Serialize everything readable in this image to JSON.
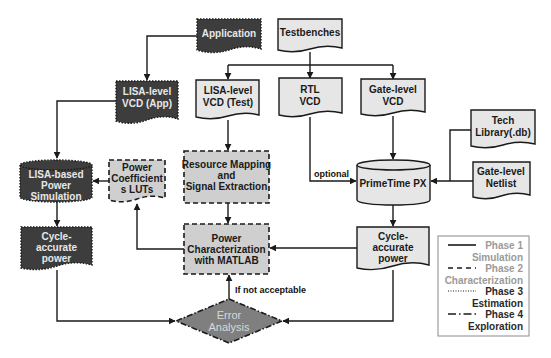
{
  "diagram": {
    "nodes": {
      "application": {
        "label_lines": [
          "Application"
        ],
        "style": "dark-dotted",
        "shape": "document"
      },
      "testbenches": {
        "label_lines": [
          "Testbenches"
        ],
        "style": "light-solid",
        "shape": "document"
      },
      "lisa_vcd_app": {
        "label_lines": [
          "LISA-level",
          "VCD (App)"
        ],
        "style": "dark-dotted",
        "shape": "document"
      },
      "lisa_vcd_test": {
        "label_lines": [
          "LISA-level",
          "VCD (Test)"
        ],
        "style": "light-solid",
        "shape": "document"
      },
      "rtl_vcd": {
        "label_lines": [
          "RTL",
          "VCD"
        ],
        "style": "light-solid",
        "shape": "document"
      },
      "gate_vcd": {
        "label_lines": [
          "Gate-level",
          "VCD"
        ],
        "style": "light-solid",
        "shape": "document"
      },
      "tech_library": {
        "label_lines": [
          "Tech",
          "Library(.db)"
        ],
        "style": "light-solid",
        "shape": "document"
      },
      "gate_netlist": {
        "label_lines": [
          "Gate-level",
          "Netlist"
        ],
        "style": "light-solid",
        "shape": "document"
      },
      "primetime": {
        "label_lines": [
          "PrimeTime PX"
        ],
        "style": "light-solid",
        "shape": "cylinder"
      },
      "cycle_power_right": {
        "label_lines": [
          "Cycle-",
          "accurate",
          "power"
        ],
        "style": "light-solid",
        "shape": "document"
      },
      "lisa_power_sim": {
        "label_lines": [
          "LISA-based",
          "Power",
          "Simulation"
        ],
        "style": "dark-dotted",
        "shape": "cylinder"
      },
      "power_coeff_luts": {
        "label_lines": [
          "Power",
          "Coefficient",
          "s LUTs"
        ],
        "style": "light-dashed",
        "shape": "document"
      },
      "resource_mapping": {
        "label_lines": [
          "Resource Mapping",
          "and",
          "Signal Extraction"
        ],
        "style": "light-dashed",
        "shape": "rect"
      },
      "power_characterization": {
        "label_lines": [
          "Power",
          "Characterization",
          "with MATLAB"
        ],
        "style": "light-dashed",
        "shape": "rect"
      },
      "cycle_power_left": {
        "label_lines": [
          "Cycle-",
          "accurate",
          "power"
        ],
        "style": "dark-dotted",
        "shape": "document"
      },
      "error_analysis": {
        "label_lines": [
          "Error",
          "Analysis"
        ],
        "style": "dash-dot",
        "shape": "diamond"
      }
    },
    "edge_labels": {
      "optional": "optional",
      "if_not_acceptable": "If not acceptable"
    },
    "edges": [
      {
        "from": "application",
        "to": "lisa_vcd_app"
      },
      {
        "from": "testbenches",
        "to": "lisa_vcd_test"
      },
      {
        "from": "testbenches",
        "to": "rtl_vcd"
      },
      {
        "from": "testbenches",
        "to": "gate_vcd"
      },
      {
        "from": "lisa_vcd_app",
        "to": "lisa_power_sim"
      },
      {
        "from": "lisa_vcd_test",
        "to": "resource_mapping"
      },
      {
        "from": "rtl_vcd",
        "to": "primetime",
        "label": "optional"
      },
      {
        "from": "gate_vcd",
        "to": "primetime"
      },
      {
        "from": "tech_library",
        "to": "primetime"
      },
      {
        "from": "gate_netlist",
        "to": "primetime"
      },
      {
        "from": "primetime",
        "to": "cycle_power_right"
      },
      {
        "from": "power_coeff_luts",
        "to": "lisa_power_sim"
      },
      {
        "from": "resource_mapping",
        "to": "power_characterization"
      },
      {
        "from": "power_characterization",
        "to": "power_coeff_luts"
      },
      {
        "from": "cycle_power_right",
        "to": "power_characterization"
      },
      {
        "from": "lisa_power_sim",
        "to": "cycle_power_left"
      },
      {
        "from": "cycle_power_left",
        "to": "error_analysis"
      },
      {
        "from": "cycle_power_right",
        "to": "error_analysis"
      },
      {
        "from": "error_analysis",
        "to": "power_characterization",
        "label": "If not acceptable"
      }
    ],
    "legend": {
      "items": [
        {
          "line_style": "solid",
          "label_line1": "Phase 1",
          "label_line2": "Simulation",
          "text_color": "#9a9a9a"
        },
        {
          "line_style": "dashed",
          "label_line1": "Phase 2",
          "label_line2": "Characterization",
          "text_color": "#9a9a9a"
        },
        {
          "line_style": "dotted",
          "label_line1": "Phase 3",
          "label_line2": "Estimation",
          "text_color": "#2a2a2a"
        },
        {
          "line_style": "dash-dot",
          "label_line1": "Phase 4",
          "label_line2": "Exploration",
          "text_color": "#2a2a2a"
        }
      ]
    },
    "colors": {
      "dark_fill": "#3d3d3d",
      "light_fill": "#e6e6e6",
      "dashed_fill": "#cfcfcf",
      "diamond_fill": "#7f7f7f",
      "stroke": "#1a1a1a"
    }
  }
}
